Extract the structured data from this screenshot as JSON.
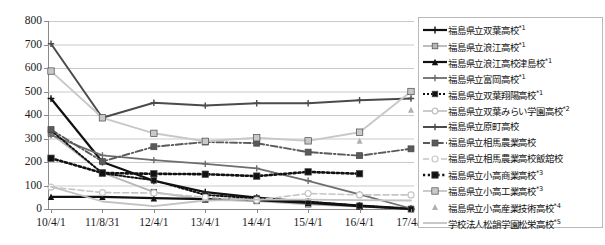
{
  "chart_data": {
    "type": "line",
    "title": "",
    "xlabel": "",
    "ylabel": "",
    "ylim": [
      0,
      800
    ],
    "ytick_step": 100,
    "grid": true,
    "legend_position": "right",
    "categories": [
      "10/4/1",
      "11/8/31",
      "12/4/1",
      "13/4/1",
      "14/4/1",
      "15/4/1",
      "16/4/1",
      "17/4/1"
    ],
    "yticks": [
      "800",
      "700",
      "600",
      "500",
      "400",
      "300",
      "200",
      "100",
      "0"
    ],
    "series": [
      {
        "name": "福島県立双葉高校",
        "note": "*1",
        "style": "solid-thick-black-plus",
        "color": "#111111",
        "values": [
          470,
          200,
          120,
          72,
          48,
          30,
          14,
          2
        ]
      },
      {
        "name": "福島県立浪江高校",
        "note": "*1",
        "style": "solid-light-gray-square",
        "color": "#b7b7b7",
        "values": [
          320,
          155,
          72,
          40,
          34,
          20,
          10,
          0
        ]
      },
      {
        "name": "福島県立浪江高校津島校",
        "note": "*1",
        "style": "solid-thick-black-triangle",
        "color": "#111111",
        "values": [
          52,
          52,
          46,
          42,
          38,
          26,
          12,
          0
        ]
      },
      {
        "name": "福島県立富岡高校",
        "note": "*1",
        "style": "solid-gray-plus",
        "color": "#6e6e6e",
        "values": [
          315,
          228,
          208,
          192,
          173,
          120,
          62,
          2
        ]
      },
      {
        "name": "福島県立双葉翔陽高校",
        "note": "*1",
        "style": "dotted-black-square",
        "color": "#111111",
        "values": [
          335,
          152,
          122,
          60,
          45,
          30,
          14,
          0
        ]
      },
      {
        "name": "福島県立双葉みらい学園高校",
        "note": "*2",
        "style": "solid-light-gray-circle",
        "color": "#bfbfbf",
        "values": [
          null,
          null,
          null,
          null,
          null,
          null,
          null,
          null
        ]
      },
      {
        "name": "福島県立原町高校",
        "note": "",
        "style": "solid-darkgray-plus",
        "color": "#4b4b4b",
        "values": [
          703,
          388,
          452,
          440,
          450,
          450,
          463,
          470
        ]
      },
      {
        "name": "福島県立相馬農業高校",
        "note": "",
        "style": "dashdot-gray-square",
        "color": "#5a5a5a",
        "values": [
          338,
          202,
          265,
          285,
          280,
          242,
          227,
          256
        ]
      },
      {
        "name": "福島県立相馬農業高校飯舘校",
        "note": "",
        "style": "dashed-lightgray-circle",
        "color": "#c5c5c5",
        "values": [
          93,
          70,
          68,
          50,
          38,
          66,
          60,
          60
        ]
      },
      {
        "name": "福島県立小高商業高校",
        "note": "*3",
        "style": "dotted-thick-black-square",
        "color": "#111111",
        "values": [
          216,
          153,
          150,
          148,
          140,
          158,
          150,
          null
        ]
      },
      {
        "name": "福島県立小高工業高校",
        "note": "*3",
        "style": "solid-lightgray-square",
        "color": "#c8c8c8",
        "values": [
          587,
          388,
          322,
          288,
          303,
          290,
          327,
          500
        ]
      },
      {
        "name": "福島県立小高産業技術高校",
        "note": "*4",
        "style": "marker-only-gray-triangle",
        "color": "#b0b0b0",
        "values": [
          null,
          null,
          null,
          null,
          null,
          null,
          290,
          422
        ]
      },
      {
        "name": "学校法人松韻学園松栄高校",
        "note": "*5",
        "style": "solid-lightgray-plain",
        "color": "#c2c2c2",
        "values": [
          95,
          32,
          12,
          36,
          40,
          40,
          38,
          36
        ]
      }
    ]
  },
  "axis": {
    "y_ticks": [
      "800",
      "700",
      "600",
      "500",
      "400",
      "300",
      "200",
      "100",
      "0"
    ],
    "x_ticks": [
      "10/4/1",
      "11/8/31",
      "12/4/1",
      "13/4/1",
      "14/4/1",
      "15/4/1",
      "16/4/1",
      "17/4/1"
    ]
  },
  "legend": {
    "items": [
      {
        "label": "福島県立双葉高校",
        "sup": "*1"
      },
      {
        "label": "福島県立浪江高校",
        "sup": "*1"
      },
      {
        "label": "福島県立浪江高校津島校",
        "sup": "*1"
      },
      {
        "label": "福島県立富岡高校",
        "sup": "*1"
      },
      {
        "label": "福島県立双葉翔陽高校",
        "sup": "*1"
      },
      {
        "label": "福島県立双葉みらい学園高校",
        "sup": "*2"
      },
      {
        "label": "福島県立原町高校",
        "sup": ""
      },
      {
        "label": "福島県立相馬農業高校",
        "sup": ""
      },
      {
        "label": "福島県立相馬農業高校飯舘校",
        "sup": ""
      },
      {
        "label": "福島県立小高商業高校",
        "sup": "*3"
      },
      {
        "label": "福島県立小高工業高校",
        "sup": "*3"
      },
      {
        "label": "福島県立小高産業技術高校",
        "sup": "*4"
      },
      {
        "label": "学校法人松韻学園松栄高校",
        "sup": "*5"
      }
    ]
  }
}
